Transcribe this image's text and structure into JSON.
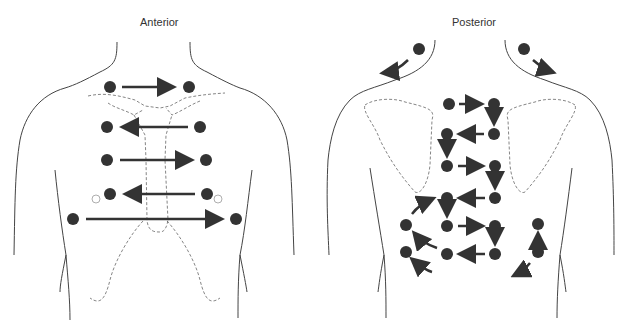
{
  "figure": {
    "panels": [
      {
        "id": "anterior",
        "title": "Anterior"
      },
      {
        "id": "posterior",
        "title": "Posterior"
      }
    ],
    "colors": {
      "dot": "#333333",
      "arrow": "#333333",
      "outline": "#444444",
      "dashed": "#666666"
    }
  },
  "anterior": {
    "title": "Anterior"
  },
  "posterior": {
    "title": "Posterior"
  }
}
